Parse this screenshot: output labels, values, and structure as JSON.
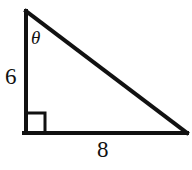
{
  "figure": {
    "type": "right-triangle",
    "background_color": "#ffffff",
    "stroke_color": "#111111",
    "stroke_width": 4,
    "canvas": {
      "width": 192,
      "height": 170
    },
    "vertices": {
      "top": {
        "x": 26,
        "y": 11
      },
      "bottom_left": {
        "x": 26,
        "y": 133
      },
      "bottom_right": {
        "x": 186,
        "y": 133
      }
    },
    "right_angle_marker": {
      "name": "right-angle-square",
      "x": 27,
      "y": 113,
      "size": 19
    },
    "labels": {
      "vertical_leg": "6",
      "horizontal_leg": "8",
      "angle": "θ"
    }
  }
}
